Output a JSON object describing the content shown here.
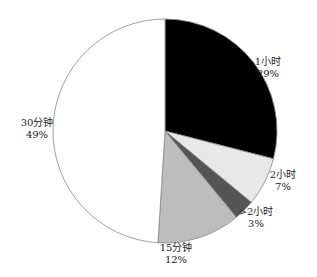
{
  "chart_data": {
    "type": "pie",
    "title": "",
    "start_angle_deg": 0,
    "direction": "clockwise",
    "center": [
      165,
      131
    ],
    "radius": 112,
    "slices": [
      {
        "label": "1小时",
        "value": 29,
        "pct_label": "29%",
        "color": "#000000",
        "label_pos": [
          268,
          65
        ]
      },
      {
        "label": "2小时",
        "value": 7,
        "pct_label": "7%",
        "color": "#e8e8e8",
        "label_pos": [
          283,
          178
        ]
      },
      {
        "label": ">2小时",
        "value": 3,
        "pct_label": "3%",
        "color": "#555555",
        "label_pos": [
          256,
          215
        ]
      },
      {
        "label": "15分钟",
        "value": 12,
        "pct_label": "12%",
        "color": "#bdbdbd",
        "label_pos": [
          176,
          251
        ]
      },
      {
        "label": "30分钟",
        "value": 49,
        "pct_label": "49%",
        "color": "#ffffff",
        "label_pos": [
          37,
          126
        ]
      }
    ],
    "legend": "none",
    "stroke_color": "#888888"
  }
}
